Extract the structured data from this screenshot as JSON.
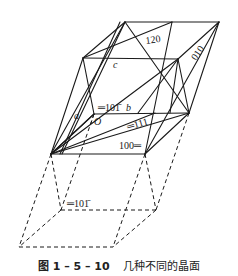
{
  "figure": {
    "type": "crystal-lattice-planes",
    "axis_labels": {
      "a": "a",
      "b": "b",
      "c": "c",
      "origin": "O"
    },
    "planes": [
      {
        "label": "120",
        "marker": "≡"
      },
      {
        "label": "010",
        "marker": "≡"
      },
      {
        "label": "101̄",
        "marker": "≡",
        "position": "upper"
      },
      {
        "label": "111",
        "marker": "≡"
      },
      {
        "label": "100",
        "marker": "≡"
      },
      {
        "label": "101̄",
        "marker": "≡",
        "position": "lower"
      }
    ],
    "colors": {
      "line": "#1a1a1a",
      "background": "#ffffff"
    }
  },
  "labels": {
    "p120": "120",
    "p010": "010",
    "p101_upper": "═101̄",
    "b_axis": "b",
    "a_axis": "a",
    "c_axis": "c",
    "origin": "O",
    "p111": "═111",
    "p100": "100═",
    "p101_lower": "═101̄"
  },
  "caption": {
    "number": "图 1 – 5 – 10",
    "title": "几种不同的晶面"
  }
}
